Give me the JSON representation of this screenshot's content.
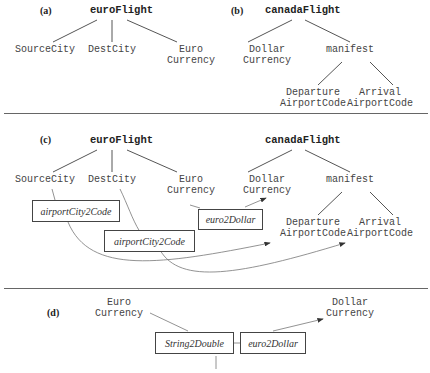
{
  "panels": {
    "a": {
      "label": "(a)",
      "root": "euroFlight",
      "children": [
        "SourceCity",
        "DestCity",
        "Euro\nCurrency"
      ]
    },
    "b": {
      "label": "(b)",
      "root": "canadaFlight",
      "children": [
        "Dollar\nCurrency",
        "manifest"
      ],
      "manifest_children": [
        "Departure\nAirportCode",
        "Arrival\nAirportCode"
      ]
    },
    "c": {
      "label": "(c)",
      "left_root": "euroFlight",
      "left_children": [
        "SourceCity",
        "DestCity",
        "Euro\nCurrency"
      ],
      "right_root": "canadaFlight",
      "right_children": [
        "Dollar\nCurrency",
        "manifest"
      ],
      "manifest_children": [
        "Departure\nAirportCode",
        "Arrival\nAirportCode"
      ],
      "functions": [
        "airportCity2Code",
        "airportCity2Code",
        "euro2Dollar"
      ]
    },
    "d": {
      "label": "(d)",
      "source": "Euro\nCurrency",
      "target": "Dollar\nCurrency",
      "functions": [
        "String2Double",
        "euro2Dollar"
      ]
    }
  },
  "colors": {
    "line": "#555555",
    "text": "#333333"
  }
}
